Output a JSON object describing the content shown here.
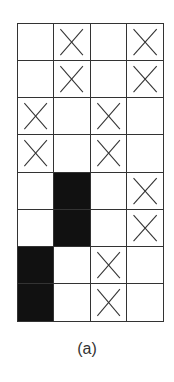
{
  "figure": {
    "caption": "(a)",
    "rows": 8,
    "cols": 4,
    "legend": {
      "X": "crossed cell",
      "B": "filled black cell",
      "_": "empty cell"
    },
    "cells": [
      [
        "_",
        "X",
        "_",
        "X"
      ],
      [
        "_",
        "X",
        "_",
        "X"
      ],
      [
        "X",
        "_",
        "X",
        "_"
      ],
      [
        "X",
        "_",
        "X",
        "_"
      ],
      [
        "_",
        "B",
        "_",
        "X"
      ],
      [
        "_",
        "B",
        "_",
        "X"
      ],
      [
        "B",
        "_",
        "X",
        "_"
      ],
      [
        "B",
        "_",
        "X",
        "_"
      ]
    ],
    "colors": {
      "line": "#333333",
      "fill": "#111111",
      "background": "#ffffff"
    }
  }
}
